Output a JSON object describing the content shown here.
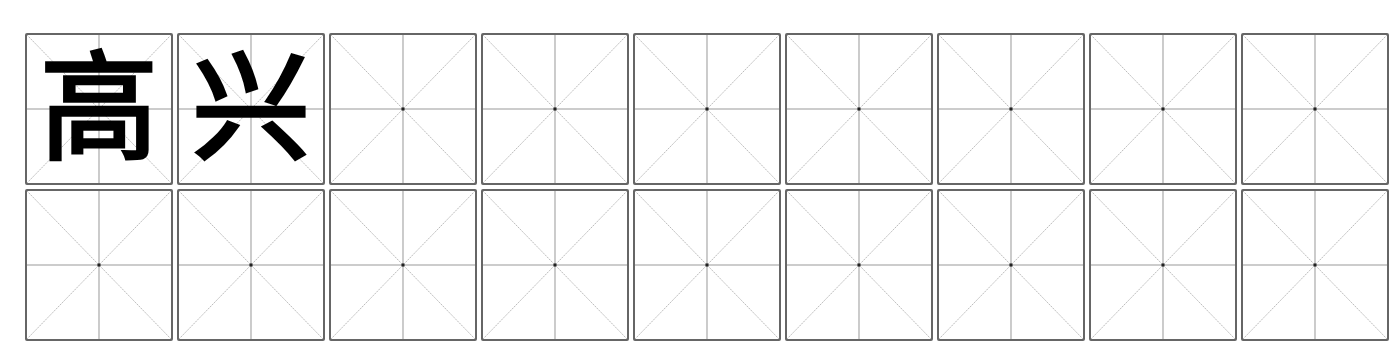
{
  "worksheet": {
    "type": "mi-zi-ge writing practice grid",
    "columns": 9,
    "rows": 2,
    "colors": {
      "border": "#666666",
      "guide_line": "#b0b0b0",
      "center_dot": "#222222",
      "character": "#000000"
    },
    "cells": [
      {
        "char": "高"
      },
      {
        "char": "兴"
      },
      {
        "char": ""
      },
      {
        "char": ""
      },
      {
        "char": ""
      },
      {
        "char": ""
      },
      {
        "char": ""
      },
      {
        "char": ""
      },
      {
        "char": ""
      },
      {
        "char": ""
      },
      {
        "char": ""
      },
      {
        "char": ""
      },
      {
        "char": ""
      },
      {
        "char": ""
      },
      {
        "char": ""
      },
      {
        "char": ""
      },
      {
        "char": ""
      },
      {
        "char": ""
      }
    ]
  }
}
